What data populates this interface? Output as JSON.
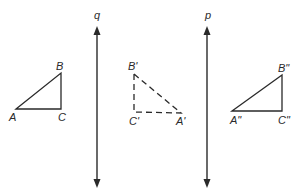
{
  "diagram": {
    "type": "geometry-reflection",
    "lines": [
      {
        "name": "q",
        "label": "q",
        "x": 97,
        "y1": 27,
        "y2": 187
      },
      {
        "name": "p",
        "label": "p",
        "x": 207,
        "y1": 27,
        "y2": 187
      }
    ],
    "triangles": [
      {
        "name": "original",
        "style": "solid",
        "vertices": {
          "A": [
            16,
            109
          ],
          "B": [
            61,
            73
          ],
          "C": [
            61,
            109
          ]
        },
        "labels": {
          "A": "A",
          "B": "B",
          "C": "C"
        }
      },
      {
        "name": "first-image",
        "style": "dashed",
        "vertices": {
          "A": [
            181,
            113
          ],
          "B": [
            134,
            74
          ],
          "C": [
            134,
            112
          ]
        },
        "labels": {
          "A": "A'",
          "B": "B'",
          "C": "C'"
        }
      },
      {
        "name": "second-image",
        "style": "solid",
        "vertices": {
          "A": [
            232,
            111
          ],
          "B": [
            282,
            75
          ],
          "C": [
            282,
            111
          ]
        },
        "labels": {
          "A": "A\"",
          "B": "B\"",
          "C": "C\""
        }
      }
    ],
    "stroke_color": "#2a2a2a"
  }
}
